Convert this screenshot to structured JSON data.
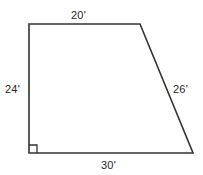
{
  "figure": {
    "name": "right-trapezoid-diagram",
    "shape_type": "right trapezoid",
    "stroke_color": "#333333",
    "fill_color": "#ffffff",
    "background_color": "#ffffff",
    "labels": {
      "top": "20'",
      "left": "24'",
      "right": "26'",
      "bottom": "30'"
    },
    "right_angle_marker": {
      "present": true,
      "vertex": "bottom-left"
    },
    "geometry": {
      "vertices": {
        "top_left": [
          29,
          24
        ],
        "top_right": [
          140,
          24
        ],
        "bottom_right": [
          193,
          153
        ],
        "bottom_left": [
          29,
          153
        ]
      },
      "polygon_points": "29,24 140,24 193,153 29,153",
      "right_angle_points": "29,145 37,145 37,153"
    }
  }
}
